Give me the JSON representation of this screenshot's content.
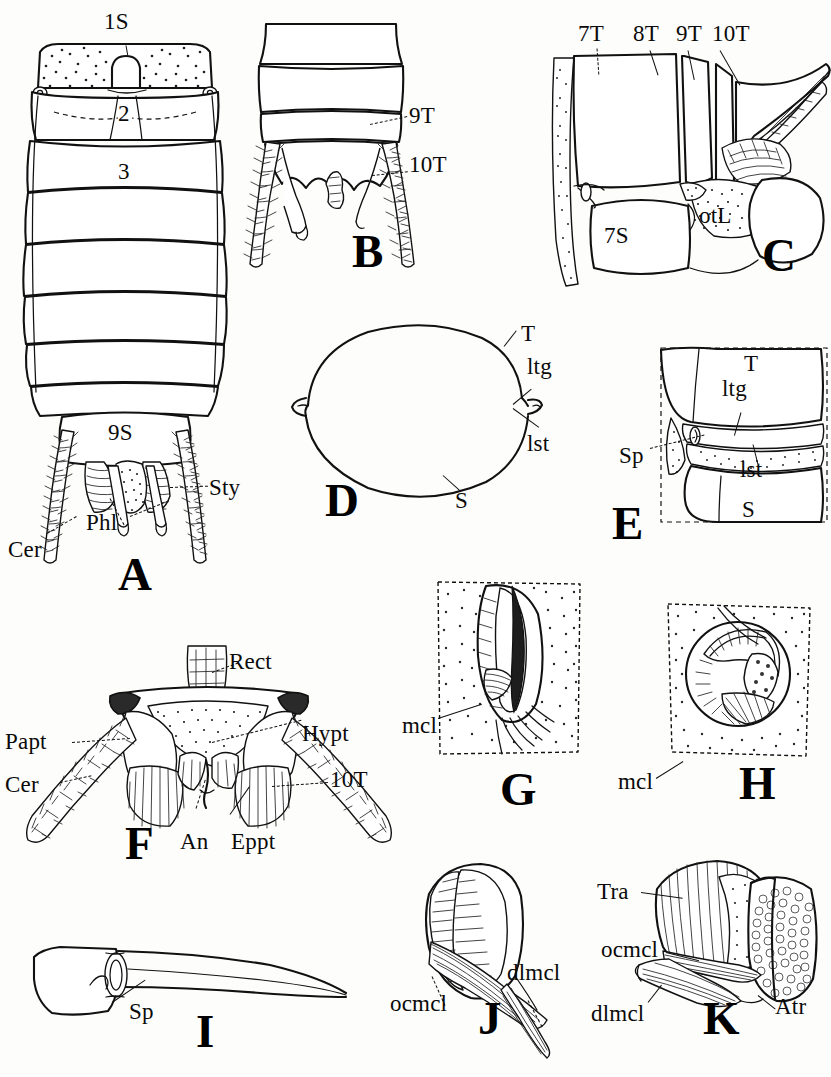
{
  "plate": {
    "type": "scientific-illustration-plate",
    "subject": "Insect abdomen, terminal segments, spiracles and spiracle muscles",
    "background_color": "#fdfdfb",
    "ink_color": "#111111",
    "width": 831,
    "height": 1077
  },
  "figures": [
    {
      "id": "A",
      "letter": "A",
      "caption_pos": {
        "x": 118,
        "y": 551
      },
      "description": "Dorsal view of abdomen showing segments and terminal appendages",
      "labels": [
        {
          "text": "1S",
          "x": 118,
          "y": 22,
          "anchor": "middle"
        },
        {
          "text": "2",
          "x": 124,
          "y": 102,
          "anchor": "middle"
        },
        {
          "text": "3",
          "x": 124,
          "y": 160,
          "anchor": "middle"
        },
        {
          "text": "9S",
          "x": 122,
          "y": 433,
          "anchor": "middle"
        },
        {
          "text": "Sty",
          "x": 210,
          "y": 487,
          "anchor": "start"
        },
        {
          "text": "Phl",
          "x": 88,
          "y": 522,
          "anchor": "start"
        },
        {
          "text": "Cer",
          "x": 12,
          "y": 549,
          "anchor": "start"
        }
      ]
    },
    {
      "id": "B",
      "letter": "B",
      "caption_pos": {
        "x": 352,
        "y": 246
      },
      "description": "Terminal abdominal segments, ventral, with cerci",
      "labels": [
        {
          "text": "9T",
          "x": 410,
          "y": 114,
          "anchor": "start"
        },
        {
          "text": "10T",
          "x": 410,
          "y": 163,
          "anchor": "start"
        }
      ]
    },
    {
      "id": "C",
      "letter": "C",
      "caption_pos": {
        "x": 762,
        "y": 240
      },
      "description": "Lateral view of terminal segments with ovipositor lobe",
      "labels": [
        {
          "text": "7T",
          "x": 578,
          "y": 28,
          "anchor": "start"
        },
        {
          "text": "8T",
          "x": 634,
          "y": 28,
          "anchor": "start"
        },
        {
          "text": "9T",
          "x": 676,
          "y": 28,
          "anchor": "start"
        },
        {
          "text": "10T",
          "x": 712,
          "y": 28,
          "anchor": "start"
        },
        {
          "text": "7S",
          "x": 605,
          "y": 232,
          "anchor": "start"
        },
        {
          "text": "otL",
          "x": 700,
          "y": 214,
          "anchor": "start"
        }
      ]
    },
    {
      "id": "D",
      "letter": "D",
      "caption_pos": {
        "x": 325,
        "y": 477
      },
      "description": "Cross section of abdominal segment, tergum and sternum",
      "labels": [
        {
          "text": "T",
          "x": 521,
          "y": 322,
          "anchor": "start"
        },
        {
          "text": "ltg",
          "x": 527,
          "y": 355,
          "anchor": "start"
        },
        {
          "text": "lst",
          "x": 527,
          "y": 432,
          "anchor": "start"
        },
        {
          "text": "S",
          "x": 455,
          "y": 497,
          "anchor": "start"
        }
      ]
    },
    {
      "id": "E",
      "letter": "E",
      "caption_pos": {
        "x": 612,
        "y": 523
      },
      "description": "Lateral abdominal wall showing spiracle between tergum and sternum",
      "labels": [
        {
          "text": "T",
          "x": 744,
          "y": 352,
          "anchor": "start"
        },
        {
          "text": "ltg",
          "x": 722,
          "y": 392,
          "anchor": "start"
        },
        {
          "text": "Sp",
          "x": 622,
          "y": 457,
          "anchor": "start"
        },
        {
          "text": "lst",
          "x": 740,
          "y": 468,
          "anchor": "start"
        },
        {
          "text": "S",
          "x": 742,
          "y": 512,
          "anchor": "start"
        }
      ]
    },
    {
      "id": "F",
      "letter": "F",
      "caption_pos": {
        "x": 125,
        "y": 826
      },
      "description": "Posterior view of terminal abdomen, anus, paraprocts and epiprocts",
      "labels": [
        {
          "text": "Rect",
          "x": 229,
          "y": 650,
          "anchor": "start"
        },
        {
          "text": "Hypt",
          "x": 302,
          "y": 722,
          "anchor": "start"
        },
        {
          "text": "Papt",
          "x": 7,
          "y": 735,
          "anchor": "start"
        },
        {
          "text": "Cer",
          "x": 7,
          "y": 779,
          "anchor": "start"
        },
        {
          "text": "10T",
          "x": 330,
          "y": 775,
          "anchor": "start"
        },
        {
          "text": "An",
          "x": 182,
          "y": 840,
          "anchor": "start"
        },
        {
          "text": "Eppt",
          "x": 232,
          "y": 840,
          "anchor": "start"
        }
      ]
    },
    {
      "id": "G",
      "letter": "G",
      "caption_pos": {
        "x": 500,
        "y": 784
      },
      "description": "Spiracle with closing muscle, surface view",
      "labels": [
        {
          "text": "mcl",
          "x": 404,
          "y": 726,
          "anchor": "start"
        }
      ]
    },
    {
      "id": "H",
      "letter": "H",
      "caption_pos": {
        "x": 739,
        "y": 778
      },
      "description": "Spiracle with occlusor muscle, oblique view",
      "labels": [
        {
          "text": "mcl",
          "x": 620,
          "y": 782,
          "anchor": "start"
        }
      ]
    },
    {
      "id": "I",
      "letter": "I",
      "caption_pos": {
        "x": 196,
        "y": 1019
      },
      "description": "Long tapering appendage with spiracle at base",
      "labels": [
        {
          "text": "Sp",
          "x": 130,
          "y": 1012,
          "anchor": "start"
        }
      ]
    },
    {
      "id": "J",
      "letter": "J",
      "caption_pos": {
        "x": 478,
        "y": 1000
      },
      "description": "Spiracle atrium with occlusor and dilator muscles",
      "labels": [
        {
          "text": "dlmcl",
          "x": 508,
          "y": 971,
          "anchor": "start"
        },
        {
          "text": "ocmcl",
          "x": 391,
          "y": 1002,
          "anchor": "start"
        }
      ]
    },
    {
      "id": "K",
      "letter": "K",
      "caption_pos": {
        "x": 703,
        "y": 1007
      },
      "description": "Trachea and atrium with occlusor and dilator muscles",
      "labels": [
        {
          "text": "Tra",
          "x": 600,
          "y": 892,
          "anchor": "start"
        },
        {
          "text": "ocmcl",
          "x": 604,
          "y": 950,
          "anchor": "start"
        },
        {
          "text": "dlmcl",
          "x": 594,
          "y": 1012,
          "anchor": "start"
        },
        {
          "text": "Atr",
          "x": 775,
          "y": 1005,
          "anchor": "start"
        }
      ]
    }
  ],
  "abbreviations": {
    "An": "anus",
    "Atr": "atrium",
    "Cer": "cercus",
    "dlmcl": "dilator muscle",
    "Eppt": "epiproct",
    "Hypt": "hypoproct",
    "lst": "laterosternite",
    "ltg": "laterotergite",
    "mcl": "muscle",
    "ocmcl": "occlusor muscle",
    "otL": "ovipositor lobe",
    "Papt": "paraproct",
    "Phl": "phallus",
    "Rect": "rectum",
    "S": "sternum",
    "Sp": "spiracle",
    "Sty": "stylus",
    "T": "tergum",
    "Tra": "trachea"
  }
}
